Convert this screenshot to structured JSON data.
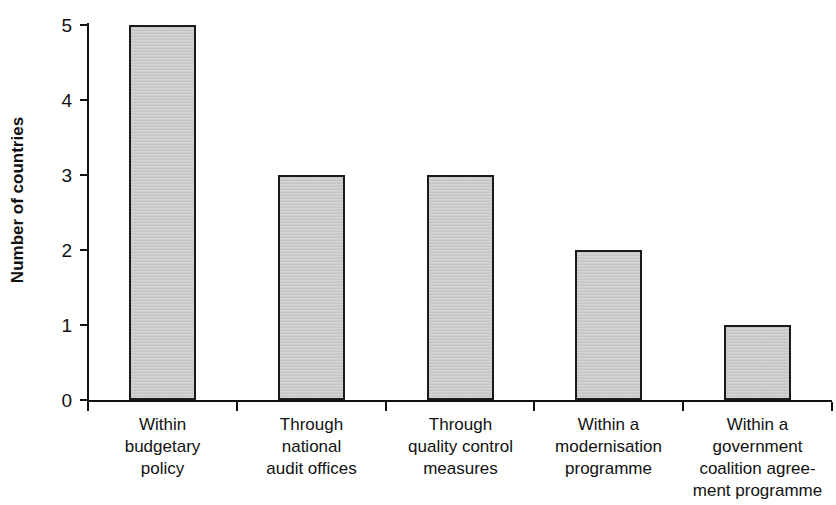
{
  "chart_data": {
    "type": "bar",
    "title": "",
    "xlabel": "",
    "ylabel": "Number of countries",
    "ylim": [
      0,
      5
    ],
    "yticks": [
      0,
      1,
      2,
      3,
      4,
      5
    ],
    "ytick_labels": [
      "0",
      "1",
      "2",
      "3",
      "4",
      "5"
    ],
    "grid": false,
    "legend": false,
    "bar_fill_color": "#c9c9c9",
    "bar_edge_color": "#1a1a1a",
    "categories": [
      "Within budgetary policy",
      "Through national audit offices",
      "Through quality control measures",
      "Within a modernisation programme",
      "Within a government coalition agreement programme"
    ],
    "category_label_lines": [
      [
        "Within",
        "budgetary",
        "policy"
      ],
      [
        "Through",
        "national",
        "audit offices"
      ],
      [
        "Through",
        "quality control",
        "measures"
      ],
      [
        "Within a",
        "modernisation",
        "programme"
      ],
      [
        "Within a",
        "government",
        "coalition agree-",
        "ment programme"
      ]
    ],
    "values": [
      5,
      3,
      3,
      2,
      1
    ]
  }
}
